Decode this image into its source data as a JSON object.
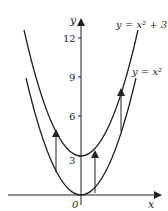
{
  "diagram": {
    "axes": {
      "x_label": "x",
      "y_label": "y",
      "origin_label": "0"
    },
    "y_ticks": [
      {
        "value": 3,
        "label": "3"
      },
      {
        "value": 6,
        "label": "6"
      },
      {
        "value": 9,
        "label": "9"
      },
      {
        "value": 12,
        "label": "12"
      }
    ],
    "curves": [
      {
        "name": "upper",
        "equation_label": "y = x² + 3",
        "shift": 3
      },
      {
        "name": "lower",
        "equation_label": "y = x²",
        "shift": 0
      }
    ],
    "arrows_description": "vertical arrows from y = x² up to y = x² + 3",
    "colors": {
      "ink": "#222222",
      "background": "#ffffff"
    }
  }
}
